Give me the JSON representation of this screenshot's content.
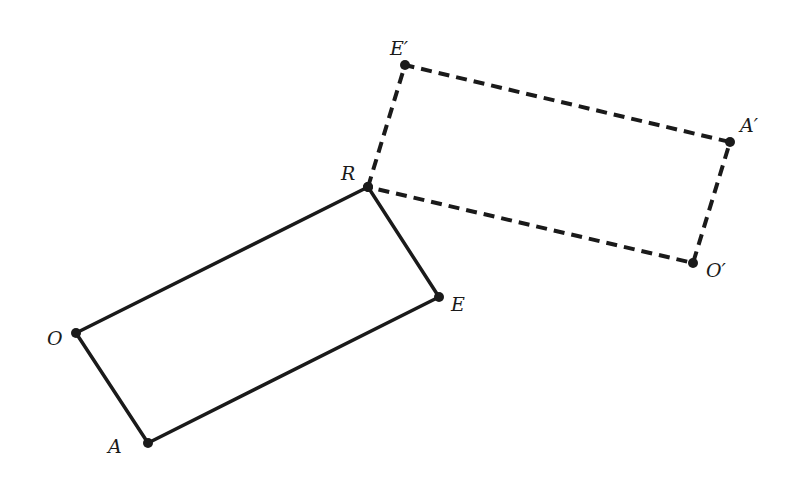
{
  "diagram": {
    "colors": {
      "stroke": "#1a1a1a",
      "background": "#ffffff"
    },
    "original": {
      "style": "solid",
      "vertices": [
        {
          "name": "R",
          "label": "R",
          "x": 368,
          "y": 187,
          "lx": 341,
          "ly": 180
        },
        {
          "name": "E",
          "label": "E",
          "x": 439,
          "y": 297,
          "lx": 451,
          "ly": 311
        },
        {
          "name": "A",
          "label": "A",
          "x": 148,
          "y": 443,
          "lx": 108,
          "ly": 453
        },
        {
          "name": "O",
          "label": "O",
          "x": 76,
          "y": 333,
          "lx": 47,
          "ly": 345
        }
      ]
    },
    "image": {
      "style": "dashed",
      "vertices": [
        {
          "name": "R",
          "label": "",
          "x": 368,
          "y": 187
        },
        {
          "name": "E'",
          "label": "E′",
          "x": 405,
          "y": 65,
          "lx": 390,
          "ly": 55
        },
        {
          "name": "A'",
          "label": "A′",
          "x": 730,
          "y": 142,
          "lx": 740,
          "ly": 132
        },
        {
          "name": "O'",
          "label": "O′",
          "x": 693,
          "y": 263,
          "lx": 706,
          "ly": 277
        }
      ]
    }
  }
}
